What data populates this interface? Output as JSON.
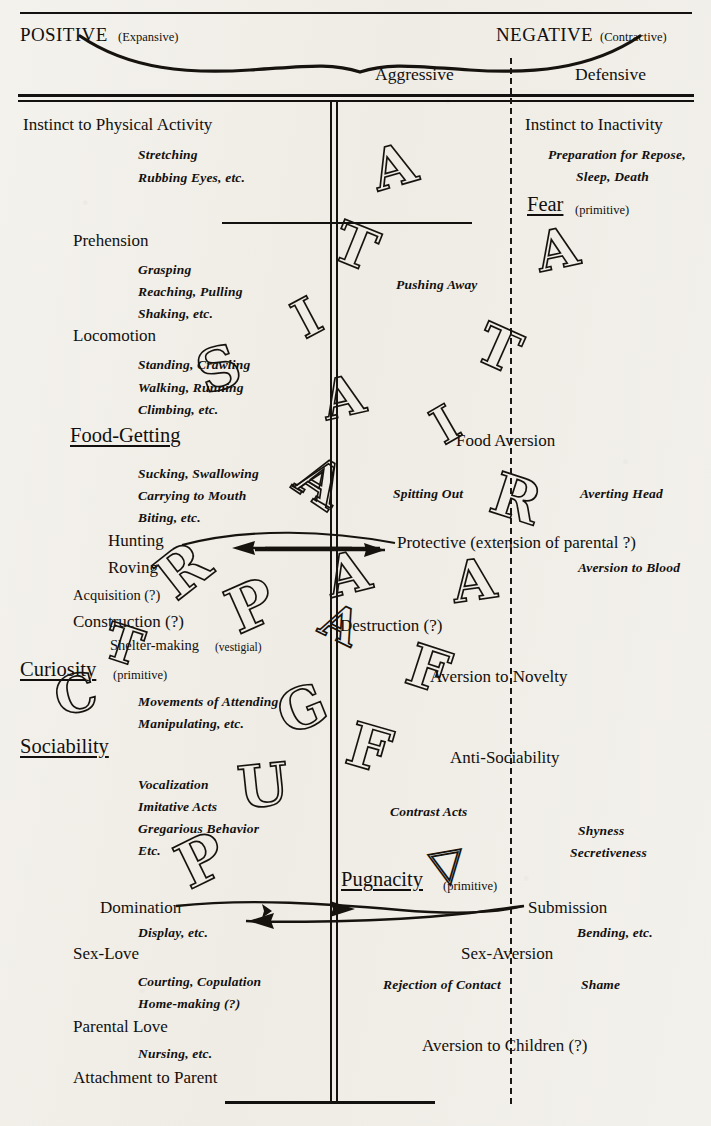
{
  "header": {
    "left_main": "POSITIVE",
    "left_paren": "(Expansive)",
    "right_main": "NEGATIVE",
    "right_paren": "(Contractive)",
    "col_aggressive": "Aggressive",
    "col_defensive": "Defensive"
  },
  "positive_column": [
    {
      "label": "Instinct to Physical Activity",
      "kind": "major",
      "sub": [
        "Stretching",
        "Rubbing Eyes, etc."
      ]
    },
    {
      "label": "Prehension",
      "kind": "major",
      "sub": [
        "Grasping",
        "Reaching, Pulling",
        "Shaking, etc."
      ]
    },
    {
      "label": "Locomotion",
      "kind": "major",
      "sub": [
        "Standing, Crawling",
        "Walking, Running",
        "Climbing, etc."
      ]
    },
    {
      "label": "Food-Getting",
      "kind": "major-underline",
      "sub": [
        "Sucking, Swallowing",
        "Carrying to Mouth",
        "Biting, etc."
      ]
    },
    {
      "label": "Hunting",
      "kind": "major",
      "sub": []
    },
    {
      "label": "Roving",
      "kind": "major",
      "sub": []
    },
    {
      "label": "Acquisition (?)",
      "kind": "minor",
      "sub": []
    },
    {
      "label": "Construction (?)",
      "kind": "major",
      "sub": []
    },
    {
      "label": "Shelter-making",
      "kind": "minor",
      "paren": "(vestigial)",
      "sub": []
    },
    {
      "label": "Curiosity",
      "kind": "major-underline",
      "paren": "(primitive)",
      "sub": [
        "Movements of Attending",
        "Manipulating, etc."
      ]
    },
    {
      "label": "Sociability",
      "kind": "major-underline",
      "sub": [
        "Vocalization",
        "Imitative Acts",
        "Gregarious Behavior",
        "Etc."
      ]
    },
    {
      "label": "Domination",
      "kind": "major",
      "sub": [
        "Display, etc."
      ]
    },
    {
      "label": "Sex-Love",
      "kind": "major",
      "sub": [
        "Courting, Copulation",
        "Home-making (?)"
      ]
    },
    {
      "label": "Parental Love",
      "kind": "major",
      "sub": [
        "Nursing, etc."
      ]
    },
    {
      "label": "Attachment to Parent",
      "kind": "major",
      "sub": []
    }
  ],
  "aggressive_column": [
    {
      "label": "Pushing Away",
      "kind": "sub"
    },
    {
      "label": "Spitting Out",
      "kind": "sub"
    },
    {
      "label": "Destruction (?)",
      "kind": "major"
    },
    {
      "label": "Contrast Acts",
      "kind": "sub"
    },
    {
      "label": "Pugnacity",
      "kind": "major-underline",
      "paren": "(primitive)"
    },
    {
      "label": "Rejection of Contact",
      "kind": "sub"
    }
  ],
  "negative_column": [
    {
      "label": "Instinct to Inactivity",
      "kind": "major",
      "sub": [
        "Preparation for Repose,",
        "Sleep, Death"
      ]
    },
    {
      "label": "Fear",
      "kind": "major-underline",
      "paren": "(primitive)",
      "sub": []
    },
    {
      "label": "Food Aversion",
      "kind": "major",
      "sub": [
        "Averting Head"
      ]
    },
    {
      "label": "Protective (extension of parental ?)",
      "kind": "major",
      "sub": [
        "Aversion to Blood"
      ]
    },
    {
      "label": "Aversion to Novelty",
      "kind": "major",
      "sub": []
    },
    {
      "label": "Anti-Sociability",
      "kind": "major",
      "sub": [
        "Shyness",
        "Secretiveness"
      ]
    },
    {
      "label": "Submission",
      "kind": "major",
      "sub": [
        "Bending, etc."
      ]
    },
    {
      "label": "Sex-Aversion",
      "kind": "major",
      "sub": [
        "Shame"
      ]
    },
    {
      "label": "Aversion to Children (?)",
      "kind": "major",
      "sub": []
    }
  ],
  "arrows": [
    {
      "name": "hunting-to-protective",
      "from": "Hunting",
      "to": "Protective (extension of parental ?)",
      "direction": "bidirectional"
    },
    {
      "name": "domination-to-submission",
      "from": "Domination",
      "to": "Submission",
      "direction": "bidirectional"
    }
  ],
  "watermark": {
    "note": "Large outline capital letters overprinted diagonally across the chart",
    "left_column_letters": [
      "S",
      "T",
      "R",
      "I",
      "K",
      "E"
    ],
    "center_column_letters": [
      "A",
      "T",
      "I",
      "A",
      "A",
      "F"
    ],
    "right_column_letters": [
      "A",
      "T",
      "I",
      "R",
      "A",
      "F"
    ],
    "lower_letters": [
      "P",
      "U",
      "G",
      "P"
    ],
    "upper_letters": [
      "A",
      "T",
      "I",
      "A",
      "A"
    ]
  },
  "colors": {
    "ink": "#15120f",
    "paper": "#f2f0eb"
  }
}
